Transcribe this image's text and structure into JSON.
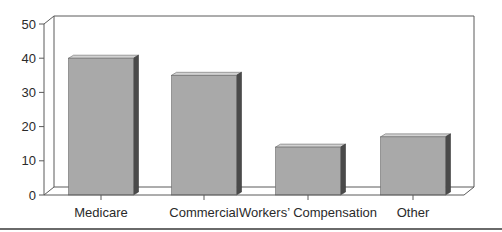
{
  "chart_data": {
    "type": "bar",
    "title": "",
    "xlabel": "",
    "ylabel": "",
    "categories": [
      "Medicare",
      "Commercial",
      "Workers’ Compensation",
      "Other"
    ],
    "values": [
      40,
      35,
      14,
      17
    ],
    "ylim": [
      0,
      50
    ],
    "yticks": [
      0,
      10,
      20,
      30,
      40,
      50
    ],
    "grid": false,
    "legend": null,
    "style": "3d-bar"
  },
  "colors": {
    "bar_front": "#a9a9a9",
    "bar_top": "#d2d2d2",
    "bar_side": "#4a4a4a",
    "axis": "#5a5a5a",
    "text": "#2a2a2a"
  }
}
